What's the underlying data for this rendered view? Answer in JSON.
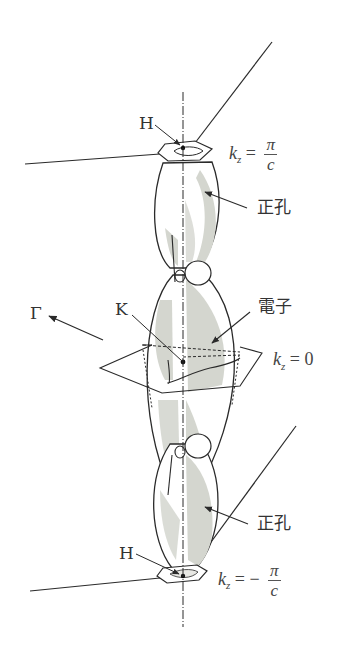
{
  "figure": {
    "title": "",
    "labels": {
      "h_top": "H",
      "h_bottom": "H",
      "kz_top_lhs": "k",
      "kz_top_sub": "z",
      "kz_top_eq": "=",
      "kz_top_num": "π",
      "kz_top_den": "c",
      "hole_top": "正孔",
      "gamma": "Γ",
      "k_point": "K",
      "electron": "電子",
      "kz_mid_lhs": "k",
      "kz_mid_sub": "z",
      "kz_mid_eq": "= 0",
      "hole_bottom": "正孔",
      "kz_bot_lhs": "k",
      "kz_bot_sub": "z",
      "kz_bot_eq": "= −",
      "kz_bot_num": "π",
      "kz_bot_den": "c"
    },
    "colors": {
      "line": "#2a2a2a",
      "shade": "#d4d6cf",
      "text": "#333333"
    }
  }
}
